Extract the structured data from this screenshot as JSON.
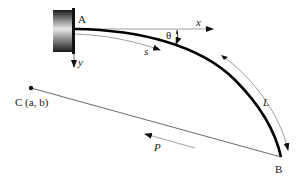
{
  "diagram": {
    "type": "cantilever-beam-with-follower-load",
    "labels": {
      "point_a": "A",
      "point_b": "B",
      "point_c": "C (a, b)",
      "axis_x": "x",
      "axis_y": "y",
      "arc_length": "s",
      "angle": "θ",
      "length": "L",
      "force": "P"
    },
    "colors": {
      "beam": "#000000",
      "lines": "#444444",
      "thin_arrows": "#888888",
      "wall_dark": "#222222",
      "wall_light": "#dddddd"
    }
  }
}
